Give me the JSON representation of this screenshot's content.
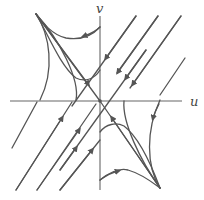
{
  "diagram": {
    "type": "phase-portrait",
    "axes": {
      "horizontal_label": "u",
      "vertical_label": "v"
    },
    "colors": {
      "stroke": "#555555",
      "axis": "#666666",
      "background": "#ffffff"
    }
  }
}
